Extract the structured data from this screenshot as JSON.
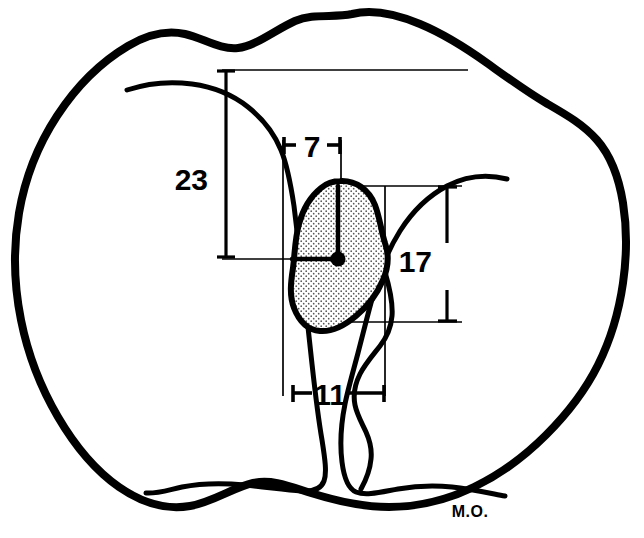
{
  "figure": {
    "background_color": "#ffffff",
    "ink_color": "#000000",
    "stipple_fill_color": "#000000",
    "width": 644,
    "height": 538
  },
  "signature": {
    "text": "M.O.",
    "x": 470,
    "y": 517
  },
  "measurements": [
    {
      "id": "m23",
      "label": "23",
      "value": 23,
      "orientation": "vertical",
      "label_x": 208,
      "label_y": 190,
      "line_x": 226,
      "line_y1": 70,
      "line_y2": 258,
      "extension_top": {
        "x1": 222,
        "y1": 70,
        "x2": 468,
        "y2": 70
      },
      "extension_bottom": {
        "x1": 222,
        "y1": 258,
        "x2": 345,
        "y2": 258
      }
    },
    {
      "id": "m7",
      "label": "7",
      "value": 7,
      "orientation": "horizontal",
      "label_x": 300,
      "label_y": 158,
      "line_y": 145,
      "line_x1": 283,
      "line_x2": 341
    },
    {
      "id": "m17",
      "label": "17",
      "value": 17,
      "orientation": "vertical",
      "label_x": 432,
      "label_y": 272,
      "line_x": 447,
      "line_y1": 186,
      "line_y2": 322,
      "extension_top": {
        "x1": 341,
        "y1": 186,
        "x2": 462,
        "y2": 186
      },
      "extension_bottom": {
        "x1": 307,
        "y1": 322,
        "x2": 462,
        "y2": 322
      }
    },
    {
      "id": "m11",
      "label": "11",
      "value": 11,
      "orientation": "horizontal",
      "label_x": 318,
      "label_y": 404,
      "line_y": 393,
      "line_x1": 292,
      "line_x2": 385
    }
  ],
  "center_point": {
    "x": 338,
    "y": 259,
    "radius": 7
  },
  "leader_lines": [
    {
      "id": "leader-vertical",
      "x1": 338,
      "y1": 259,
      "x2": 338,
      "y2": 186
    },
    {
      "id": "leader-horizontal",
      "x1": 338,
      "y1": 259,
      "x2": 292,
      "y2": 259
    }
  ],
  "construction_lines": [
    {
      "id": "left-vertical",
      "x1": 283,
      "y1": 145,
      "x2": 283,
      "y2": 393
    },
    {
      "id": "right-vertical",
      "x1": 341,
      "y1": 145,
      "x2": 341,
      "y2": 186
    },
    {
      "id": "inner-right-vertical",
      "x1": 385,
      "y1": 186,
      "x2": 385,
      "y2": 393
    }
  ],
  "shapes": {
    "outer_contour_name": "tibial-plateau-outline",
    "left_condyle_name": "medial-condyle-outline",
    "right_condyle_name": "lateral-condyle-outline",
    "stippled_region_name": "stippled-footprint-region"
  }
}
